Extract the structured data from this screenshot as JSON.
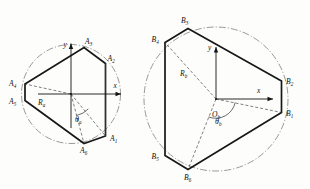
{
  "figure": {
    "background_color": "#fdfdfc",
    "stroke_color": "#171717",
    "circle_color": "#6e6e6e"
  },
  "left_diagram": {
    "name": "hexagon-a",
    "axis_x_label": "x",
    "axis_y_label": "y",
    "radius_label": "R",
    "radius_subscript": "a",
    "angle_label": "θ",
    "angle_subscript": "a",
    "vertices": [
      {
        "id": "A1",
        "letter": "A",
        "subscript": "1",
        "x": 105.5,
        "y": 136.0,
        "label_x": 110.0,
        "label_y": 141.0
      },
      {
        "id": "A2",
        "letter": "A",
        "subscript": "2",
        "x": 105.5,
        "y": 63.5,
        "label_x": 107.5,
        "label_y": 61.0
      },
      {
        "id": "A3",
        "letter": "A",
        "subscript": "3",
        "x": 84.0,
        "y": 47.5,
        "label_x": 85.0,
        "label_y": 44.0
      },
      {
        "id": "A4",
        "letter": "A",
        "subscript": "4",
        "x": 25.0,
        "y": 84.0,
        "label_x": 10.0,
        "label_y": 86.0
      },
      {
        "id": "A5",
        "letter": "A",
        "subscript": "5",
        "x": 25.0,
        "y": 100.5,
        "label_x": 10.0,
        "label_y": 103.5
      },
      {
        "id": "A6",
        "letter": "A",
        "subscript": "6",
        "x": 84.0,
        "y": 143.5,
        "label_x": 82.0,
        "label_y": 152.0
      }
    ],
    "circle": {
      "cx": 71.0,
      "cy": 94.0,
      "r": 49.5
    },
    "origin": {
      "x": 71.0,
      "y": 94.0
    }
  },
  "right_diagram": {
    "name": "hexagon-b",
    "axis_x_label": "x",
    "axis_y_label": "y",
    "radius_label": "R",
    "radius_subscript": "b",
    "angle_label": "θ",
    "angle_subscript": "b",
    "origin_label": "O",
    "origin_subscript": "b",
    "vertices": [
      {
        "id": "B1",
        "letter": "B",
        "subscript": "1",
        "x": 281.5,
        "y": 112.5,
        "label_x": 286.0,
        "label_y": 115.5
      },
      {
        "id": "B2",
        "letter": "B",
        "subscript": "2",
        "x": 281.5,
        "y": 81.0,
        "label_x": 286.0,
        "label_y": 84.0
      },
      {
        "id": "B3",
        "letter": "B",
        "subscript": "3",
        "x": 188.0,
        "y": 28.5,
        "label_x": 181.5,
        "label_y": 22.5
      },
      {
        "id": "B4",
        "letter": "B",
        "subscript": "4",
        "x": 165.0,
        "y": 42.5,
        "label_x": 152.0,
        "label_y": 41.5
      },
      {
        "id": "B5",
        "letter": "B",
        "subscript": "5",
        "x": 165.0,
        "y": 155.5,
        "label_x": 152.0,
        "label_y": 158.5
      },
      {
        "id": "B6",
        "letter": "B",
        "subscript": "6",
        "x": 188.0,
        "y": 169.5,
        "label_x": 185.0,
        "label_y": 179.0
      }
    ],
    "circle": {
      "cx": 216.0,
      "cy": 99.0,
      "r": 72.0
    },
    "origin": {
      "x": 216.0,
      "y": 99.0
    }
  }
}
